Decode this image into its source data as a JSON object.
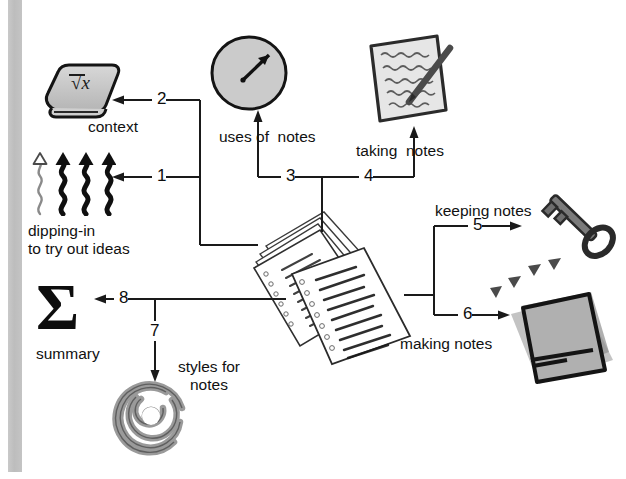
{
  "diagram": {
    "background_color": "#ffffff",
    "left_band_color": "#c2c2c2",
    "line_color": "#1a1a1a",
    "labels": [
      {
        "id": "context",
        "text": "context",
        "x": 88,
        "y": 118
      },
      {
        "id": "dipping-line1",
        "text": "dipping-in",
        "x": 28,
        "y": 222
      },
      {
        "id": "dipping-line2",
        "text": "to try out ideas",
        "x": 28,
        "y": 240
      },
      {
        "id": "uses-of-notes",
        "text": "uses of  notes",
        "x": 219,
        "y": 128
      },
      {
        "id": "taking-notes",
        "text": "taking  notes",
        "x": 356,
        "y": 142
      },
      {
        "id": "keeping-notes",
        "text": "keeping notes",
        "x": 435,
        "y": 202
      },
      {
        "id": "making-notes",
        "text": "making notes",
        "x": 400,
        "y": 335
      },
      {
        "id": "summary",
        "text": "summary",
        "x": 36,
        "y": 345
      },
      {
        "id": "styles-line1",
        "text": "styles for",
        "x": 178,
        "y": 358
      },
      {
        "id": "styles-line2",
        "text": "notes",
        "x": 190,
        "y": 376
      }
    ],
    "connector_numbers": [
      {
        "id": "n1",
        "text": "1",
        "x": 157,
        "y": 178
      },
      {
        "id": "n2",
        "text": "2",
        "x": 157,
        "y": 101
      },
      {
        "id": "n3",
        "text": "3",
        "x": 286,
        "y": 168
      },
      {
        "id": "n4",
        "text": "4",
        "x": 364,
        "y": 168
      },
      {
        "id": "n5",
        "text": "5",
        "x": 473,
        "y": 226
      },
      {
        "id": "n6",
        "text": "6",
        "x": 463,
        "y": 313
      },
      {
        "id": "n7",
        "text": "7",
        "x": 150,
        "y": 330
      },
      {
        "id": "n8",
        "text": "8",
        "x": 119,
        "y": 292
      }
    ],
    "icons": [
      {
        "id": "book-icon",
        "name": "book-sqrt-x",
        "caption": "context"
      },
      {
        "id": "squiggle-icon",
        "name": "squiggly-up-arrows",
        "caption": "dipping-in to try out ideas"
      },
      {
        "id": "gauge-icon",
        "name": "gauge-circle",
        "caption": "uses of  notes"
      },
      {
        "id": "notepad-icon",
        "name": "notepad-pencil",
        "caption": "taking  notes"
      },
      {
        "id": "pages-stack-icon",
        "name": "loose-leaf-pages",
        "caption": ""
      },
      {
        "id": "key-icon",
        "name": "skeleton-key",
        "caption": "keeping notes"
      },
      {
        "id": "notecard-icon",
        "name": "notecard-stack",
        "caption": "making notes"
      },
      {
        "id": "sigma-icon",
        "name": "sigma-summary",
        "caption": "summary"
      },
      {
        "id": "spiral-icon",
        "name": "spiral",
        "caption": "styles for notes"
      }
    ],
    "book_symbol": "√x",
    "sigma_symbol": "Σ"
  }
}
